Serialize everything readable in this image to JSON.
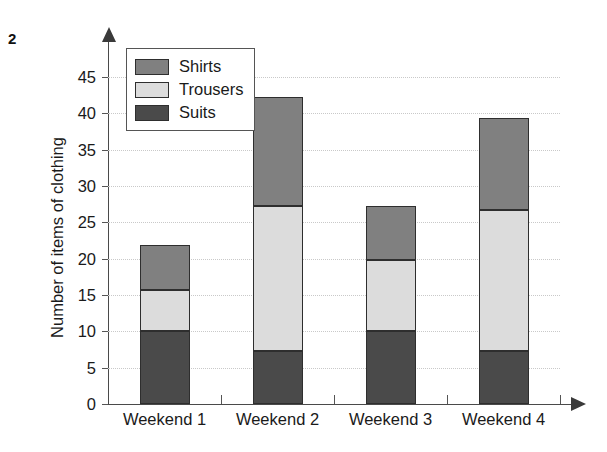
{
  "question_number": "2",
  "chart_data": {
    "type": "bar",
    "subtype": "stacked-vertical",
    "title": "",
    "xlabel": "",
    "ylabel": "Number of items of clothing",
    "categories": [
      "Weekend 1",
      "Weekend 2",
      "Weekend 3",
      "Weekend 4"
    ],
    "series": [
      {
        "name": "Suits",
        "color": "#4a4a4a",
        "values": [
          10,
          7.3,
          10,
          7.3
        ]
      },
      {
        "name": "Trousers",
        "color": "#dcdcdc",
        "values": [
          5.7,
          20,
          9.8,
          19.4
        ]
      },
      {
        "name": "Shirts",
        "color": "#808080",
        "values": [
          6.2,
          15,
          7.5,
          12.6
        ]
      }
    ],
    "stack_tops": {
      "Weekend 1": {
        "Suits": 10,
        "Trousers": 15.7,
        "Shirts": 21.9
      },
      "Weekend 2": {
        "Suits": 7.3,
        "Trousers": 27.3,
        "Shirts": 42.3
      },
      "Weekend 3": {
        "Suits": 10,
        "Trousers": 19.8,
        "Shirts": 27.3
      },
      "Weekend 4": {
        "Suits": 7.3,
        "Trousers": 26.7,
        "Shirts": 39.3
      }
    },
    "totals": [
      21.9,
      42.3,
      27.3,
      39.3
    ],
    "ylim": [
      0,
      45
    ],
    "ytick_step": 5,
    "yticks": [
      "0",
      "5",
      "10",
      "15",
      "20",
      "25",
      "30",
      "35",
      "40",
      "45"
    ],
    "grid": true,
    "grid_style": "dotted",
    "legend_position": "top-left-inside",
    "legend_order": [
      "Shirts",
      "Trousers",
      "Suits"
    ],
    "axis_arrows": {
      "y": true,
      "x": true
    }
  },
  "legend": {
    "items": [
      {
        "label": "Shirts",
        "color": "#808080"
      },
      {
        "label": "Trousers",
        "color": "#dcdcdc"
      },
      {
        "label": "Suits",
        "color": "#4a4a4a"
      }
    ]
  }
}
